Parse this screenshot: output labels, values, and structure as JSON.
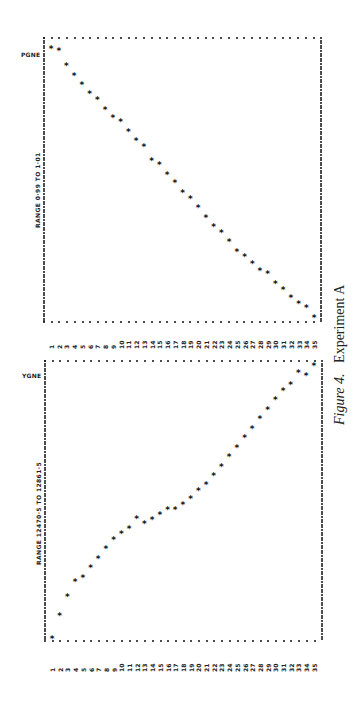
{
  "caption": {
    "figure": "Figure 4.",
    "title": "Experiment A"
  },
  "chart_data": [
    {
      "type": "scatter",
      "title": "PGNE",
      "range_label": "RANGE 0·99 TO 1·01",
      "xlabel": "",
      "ylabel": "PGNE",
      "ylim": [
        0.99,
        1.01
      ],
      "x_ticks": [
        "1",
        "2",
        "3",
        "4",
        "5",
        "6",
        "7",
        "8",
        "9",
        "10",
        "11",
        "12",
        "13",
        "14",
        "15",
        "16",
        "17",
        "18",
        "19",
        "20",
        "21",
        "22",
        "23",
        "24",
        "25",
        "26",
        "27",
        "28",
        "29",
        "30",
        "31",
        "32",
        "33",
        "34",
        "35"
      ],
      "x": [
        1,
        2,
        3,
        4,
        5,
        6,
        7,
        8,
        9,
        10,
        11,
        12,
        13,
        14,
        15,
        16,
        17,
        18,
        19,
        20,
        21,
        22,
        23,
        24,
        25,
        26,
        27,
        28,
        29,
        30,
        31,
        32,
        33,
        34,
        35
      ],
      "values": [
        1.0094,
        1.0092,
        1.0082,
        1.0075,
        1.0068,
        1.0062,
        1.0058,
        1.0051,
        1.0045,
        1.0042,
        1.0035,
        1.0029,
        1.0025,
        1.0015,
        1.0012,
        1.0005,
        0.9999,
        0.9992,
        0.9988,
        0.9982,
        0.9975,
        0.9968,
        0.9964,
        0.9958,
        0.9951,
        0.9947,
        0.9942,
        0.9937,
        0.9935,
        0.9928,
        0.9924,
        0.9918,
        0.9914,
        0.9911,
        0.9904
      ],
      "marker": "*",
      "grid": false,
      "orientation": "rotated 90° (index along page width, value along page height)"
    },
    {
      "type": "scatter",
      "title": "YGNE",
      "range_label": "RANGE 12470·5 TO 12861·5",
      "xlabel": "",
      "ylabel": "YGNE",
      "ylim": [
        12470.5,
        12861.5
      ],
      "x_ticks": [
        "1",
        "2",
        "3",
        "4",
        "5",
        "6",
        "7",
        "8",
        "9",
        "10",
        "11",
        "12",
        "13",
        "14",
        "15",
        "16",
        "17",
        "18",
        "19",
        "20",
        "21",
        "22",
        "23",
        "24",
        "25",
        "26",
        "27",
        "28",
        "29",
        "30",
        "31",
        "32",
        "33",
        "34",
        "35"
      ],
      "x": [
        1,
        2,
        3,
        4,
        5,
        6,
        7,
        8,
        9,
        10,
        11,
        12,
        13,
        14,
        15,
        16,
        17,
        18,
        19,
        20,
        21,
        22,
        23,
        24,
        25,
        26,
        27,
        28,
        29,
        30,
        31,
        32,
        33,
        34,
        35
      ],
      "values": [
        12476,
        12508,
        12535,
        12556,
        12561,
        12575,
        12588,
        12602,
        12614,
        12623,
        12630,
        12644,
        12637,
        12642,
        12649,
        12656,
        12656,
        12663,
        12672,
        12683,
        12691,
        12704,
        12716,
        12730,
        12743,
        12757,
        12769,
        12783,
        12796,
        12810,
        12822,
        12831,
        12848,
        12843,
        12857
      ],
      "marker": "*",
      "grid": false,
      "orientation": "rotated 90° (index along page width, value along page height)"
    }
  ],
  "layout": {
    "panels": [
      {
        "frame": {
          "left": 44,
          "top": 38,
          "right": 321,
          "bottom": 322
        },
        "label_y": 54,
        "range_y": 228,
        "range_x": 37,
        "tick_y": 349,
        "x0": 51,
        "dx": 7.74
      },
      {
        "frame": {
          "left": 45,
          "top": 361,
          "right": 322,
          "bottom": 641
        },
        "label_y": 377,
        "range_y": 565,
        "range_x": 39,
        "tick_y": 672,
        "x0": 52,
        "dx": 7.7
      }
    ],
    "ink": "#111111"
  }
}
